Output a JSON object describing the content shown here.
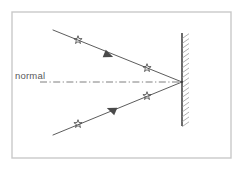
{
  "figure": {
    "type": "optics-ray-diagram",
    "width": 243,
    "height": 170,
    "background_color": "#ffffff"
  },
  "border": {
    "name": "outer-frame",
    "color": "#c9c9c9",
    "x": 12,
    "y": 12,
    "width": 219,
    "height": 146,
    "stroke_width": 1.4
  },
  "mirror": {
    "label": "",
    "color": "#3a3a3a",
    "x": 182,
    "y_top": 33,
    "y_bottom": 126,
    "stroke_width": 1.5,
    "hatch_side": "right",
    "hatch_color": "#8e8e8e",
    "hatch_count": 19,
    "hatch_length": 7
  },
  "normal": {
    "label": "normal",
    "color": "#6f6f6f",
    "style": "dash-dot",
    "x_start": 40,
    "x_end": 182,
    "y": 82,
    "stroke_width": 0.9,
    "label_x": 15,
    "label_y": 79
  },
  "rays": [
    {
      "name": "incident-ray",
      "color": "#4a4a4a",
      "stroke_width": 0.9,
      "x1": 53,
      "y1": 30,
      "x2": 182,
      "y2": 82,
      "direction": "toward-mirror",
      "arrow": {
        "x": 108,
        "y": 55,
        "angle": 22,
        "size": 9
      },
      "stars": [
        {
          "x": 78,
          "y": 40
        },
        {
          "x": 147,
          "y": 68
        }
      ]
    },
    {
      "name": "reflected-ray",
      "color": "#4a4a4a",
      "stroke_width": 0.9,
      "x1": 182,
      "y1": 82,
      "x2": 53,
      "y2": 135,
      "direction": "away-from-mirror",
      "arrow": {
        "x": 112,
        "y": 110,
        "angle": 202,
        "size": 9
      },
      "stars": [
        {
          "x": 147,
          "y": 96
        },
        {
          "x": 78,
          "y": 124
        }
      ]
    }
  ],
  "incidence_point": {
    "name": "point-of-incidence",
    "x": 182,
    "y": 82
  }
}
